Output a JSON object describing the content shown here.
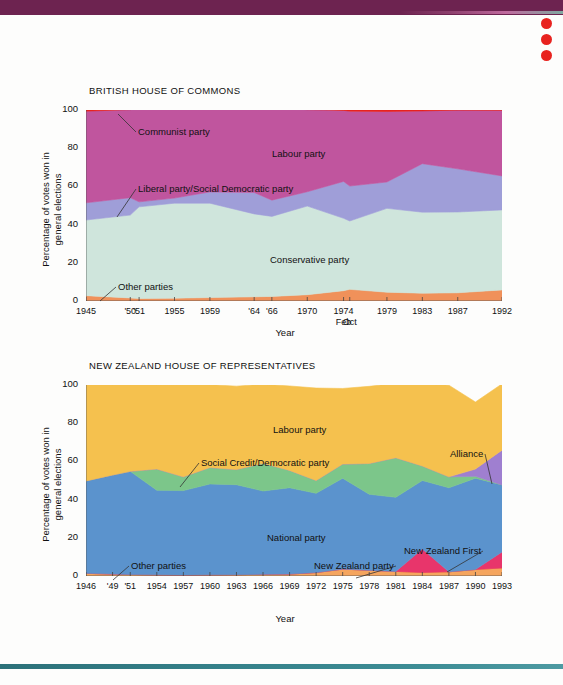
{
  "page": {
    "background_color": "#fdfdfc",
    "top_band_color": "#6d2350",
    "bottom_band_color": "#35818a",
    "dot_color": "#e8231f",
    "dots_count": 3
  },
  "chart_data": [
    {
      "type": "area",
      "id": "british-house-of-commons",
      "title": "BRITISH HOUSE OF COMMONS",
      "xlabel": "Year",
      "ylabel": "Percentage of votes won in\ngeneral elections",
      "ylim": [
        0,
        100
      ],
      "yticks": [
        0,
        20,
        40,
        60,
        80,
        100
      ],
      "ytick_labels": [
        "0",
        "20",
        "40",
        "60",
        "80",
        "100"
      ],
      "grid": false,
      "stacked": true,
      "legend_position": "inline-annotations",
      "x": [
        1945,
        1950,
        1951,
        1955,
        1959,
        1964,
        1966,
        1970,
        1974.1,
        1974.8,
        1979,
        1983,
        1987,
        1992
      ],
      "xtick_labels": [
        "1945",
        "'50",
        "'51",
        "1955",
        "1959",
        "'64",
        "'66",
        "1970",
        "1974",
        "",
        "1979",
        "1983",
        "1987",
        "1992"
      ],
      "xtick_sublabels": [
        "",
        "",
        "",
        "",
        "",
        "",
        "",
        "",
        "Feb",
        "Oct",
        "",
        "",
        "",
        ""
      ],
      "series": [
        {
          "name": "Other parties",
          "color": "#f0915a",
          "values": [
            2.8,
            1.6,
            1.3,
            1.5,
            1.8,
            2.2,
            2.4,
            3.3,
            5.4,
            6.1,
            4.6,
            4.1,
            4.3,
            5.8
          ]
        },
        {
          "name": "Conservative party",
          "color": "#cfe5dc",
          "values": [
            39.6,
            43.4,
            48.0,
            49.7,
            49.4,
            43.4,
            41.9,
            46.4,
            37.9,
            35.8,
            43.9,
            42.4,
            42.3,
            41.9
          ]
        },
        {
          "name": "Liberal party/Social Democratic party",
          "color": "#9f9ed8",
          "values": [
            9.0,
            9.1,
            2.6,
            2.7,
            5.9,
            11.2,
            8.5,
            7.5,
            19.3,
            18.3,
            13.8,
            25.4,
            22.6,
            17.8
          ]
        },
        {
          "name": "Labour party",
          "color": "#c0559e",
          "values": [
            48.0,
            46.1,
            48.8,
            46.4,
            43.8,
            44.1,
            48.0,
            43.0,
            37.2,
            39.2,
            36.9,
            27.6,
            30.8,
            34.4
          ]
        },
        {
          "name": "Communist party",
          "color": "#e8231f",
          "values": [
            0.6,
            0.8,
            0.3,
            0.7,
            0.1,
            0.1,
            0.2,
            0.8,
            0.2,
            0.6,
            0.8,
            0.5,
            0.0,
            0.1
          ]
        }
      ],
      "annotations": [
        {
          "label": "Communist party",
          "x_px": 138,
          "y_px": 126,
          "leader_to_x": 118,
          "leader_to_y": 114
        },
        {
          "label": "Labour party",
          "x_px": 272,
          "y_px": 148
        },
        {
          "label": "Liberal party/Social Democratic party",
          "x_px": 138,
          "y_px": 183,
          "leader_to_x": 117,
          "leader_to_y": 217
        },
        {
          "label": "Conservative party",
          "x_px": 270,
          "y_px": 254
        },
        {
          "label": "Other parties",
          "x_px": 118,
          "y_px": 281,
          "leader_to_x": 100,
          "leader_to_y": 301
        }
      ]
    },
    {
      "type": "area",
      "id": "new-zealand-house-of-representatives",
      "title": "NEW ZEALAND HOUSE OF REPRESENTATIVES",
      "xlabel": "Year",
      "ylabel": "Percentage of votes won in\ngeneral elections",
      "ylim": [
        0,
        100
      ],
      "yticks": [
        0,
        20,
        40,
        60,
        80,
        100
      ],
      "ytick_labels": [
        "0",
        "20",
        "40",
        "60",
        "80",
        "100"
      ],
      "grid": false,
      "stacked": true,
      "legend_position": "inline-annotations",
      "x": [
        1946,
        1949,
        1951,
        1954,
        1957,
        1960,
        1963,
        1966,
        1969,
        1972,
        1975,
        1978,
        1981,
        1984,
        1987,
        1990,
        1993
      ],
      "xtick_labels": [
        "1946",
        "'49",
        "'51",
        "1954",
        "1957",
        "1960",
        "1963",
        "1966",
        "1969",
        "1972",
        "1975",
        "1978",
        "1981",
        "1984",
        "1987",
        "1990",
        "1993"
      ],
      "series": [
        {
          "name": "Other parties",
          "color": "#f5a55e",
          "values": [
            1.4,
            1.0,
            0.8,
            0.6,
            0.5,
            0.6,
            0.7,
            0.9,
            1.0,
            1.8,
            3.6,
            3.0,
            2.4,
            1.8,
            2.2,
            3.4,
            4.2
          ]
        },
        {
          "name": "New Zealand party",
          "color": "#f08a3c",
          "values": [
            0,
            0,
            0,
            0,
            0,
            0,
            0,
            0,
            0,
            0,
            0,
            0,
            0,
            0,
            0,
            0,
            0
          ]
        },
        {
          "name": "New Zealand First",
          "color": "#e8356b",
          "values": [
            0,
            0,
            0,
            0,
            0,
            0,
            0,
            0,
            0,
            0,
            0,
            0,
            0,
            12.3,
            0,
            0,
            8.4
          ]
        },
        {
          "name": "National party",
          "color": "#5b93cd",
          "values": [
            48.4,
            51.9,
            54.0,
            44.3,
            44.2,
            47.6,
            47.1,
            43.6,
            45.2,
            41.5,
            47.6,
            39.8,
            38.8,
            35.9,
            44.0,
            47.8,
            35.1
          ]
        },
        {
          "name": "Social Credit/Democratic party",
          "color": "#7cc68a",
          "values": [
            0.0,
            0.0,
            0.0,
            11.1,
            7.2,
            8.6,
            7.9,
            14.5,
            9.1,
            6.7,
            7.4,
            16.1,
            20.7,
            7.6,
            5.7,
            1.0,
            0.0
          ]
        },
        {
          "name": "Alliance",
          "color": "#9f7fd0",
          "values": [
            0,
            0,
            0,
            0,
            0,
            0,
            0,
            0,
            0,
            0,
            0,
            0,
            0,
            0,
            0,
            3.8,
            18.2
          ]
        },
        {
          "name": "Labour party",
          "color": "#f5c14e",
          "values": [
            50.2,
            47.1,
            45.2,
            44.0,
            48.3,
            43.4,
            43.7,
            41.4,
            44.2,
            48.4,
            39.6,
            40.4,
            39.0,
            43.0,
            48.0,
            35.1,
            34.7
          ]
        }
      ],
      "annotations": [
        {
          "label": "Labour party",
          "x_px": 273,
          "y_px": 424
        },
        {
          "label": "Social Credit/Democratic party",
          "x_px": 201,
          "y_px": 457,
          "leader_to_x": 180,
          "leader_to_y": 487
        },
        {
          "label": "Alliance",
          "x_px": 450,
          "y_px": 448,
          "leader_to_x": 492,
          "leader_to_y": 484
        },
        {
          "label": "National party",
          "x_px": 267,
          "y_px": 532
        },
        {
          "label": "New Zealand First",
          "x_px": 404,
          "y_px": 545,
          "leader_to_x": 447,
          "leader_to_y": 572
        },
        {
          "label": "New Zealand party",
          "x_px": 314,
          "y_px": 560,
          "leader_to_x": 356,
          "leader_to_y": 578
        },
        {
          "label": "Other parties",
          "x_px": 131,
          "y_px": 560,
          "leader_to_x": 113,
          "leader_to_y": 580
        }
      ]
    }
  ]
}
